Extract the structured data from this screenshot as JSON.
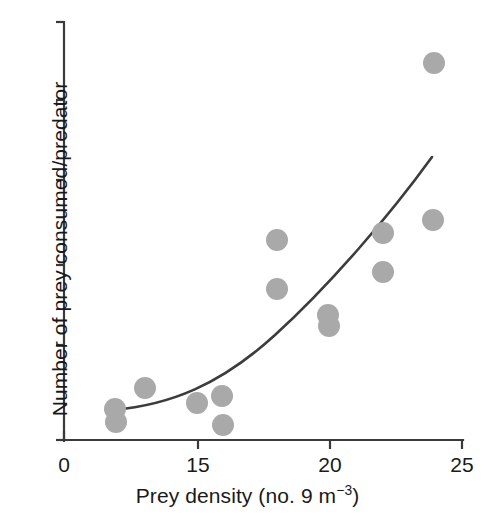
{
  "chart_data": {
    "type": "scatter",
    "title": "",
    "xlabel": "Prey density (no. 9 m−3)",
    "ylabel": "Number of prey consumed/predator",
    "xlabel_main": "Prey density (no. 9 m",
    "xlabel_exponent": "−3",
    "xlabel_tail": ")",
    "grid": false,
    "legend": "none",
    "x_ticks": [
      {
        "label": "0",
        "value": 0,
        "px": 64
      },
      {
        "label": "15",
        "value": 15,
        "px": 198
      },
      {
        "label": "20",
        "value": 20,
        "px": 330
      },
      {
        "label": "25",
        "value": 25,
        "px": 462
      }
    ],
    "y_ticks": [
      {
        "label": "",
        "px": 22
      },
      {
        "label": "",
        "px": 100
      },
      {
        "label": "",
        "px": 180
      },
      {
        "label": "",
        "px": 265
      },
      {
        "label": "",
        "px": 345
      },
      {
        "label": "",
        "px": 440
      }
    ],
    "xlim": [
      0,
      25
    ],
    "ylim": [
      0,
      6
    ],
    "y_axis_labeled": false,
    "marker_color": "#a9a9a9",
    "marker_radius_px": 11,
    "curve_color": "#3c3c3c",
    "axis_color": "#3a3a3a",
    "points": [
      {
        "x": 6,
        "y": 0.45,
        "px": 115,
        "py": 409
      },
      {
        "x": 6,
        "y": 0.3,
        "px": 116,
        "py": 422
      },
      {
        "x": 9,
        "y": 0.72,
        "px": 145,
        "py": 388
      },
      {
        "x": 15,
        "y": 0.54,
        "px": 197,
        "py": 403
      },
      {
        "x": 16,
        "y": 0.62,
        "px": 222,
        "py": 396
      },
      {
        "x": 16,
        "y": 0.2,
        "px": 223,
        "py": 425
      },
      {
        "x": 18,
        "y": 2.58,
        "px": 277,
        "py": 240
      },
      {
        "x": 18,
        "y": 2.02,
        "px": 277,
        "py": 289
      },
      {
        "x": 20,
        "y": 1.72,
        "px": 328,
        "py": 315
      },
      {
        "x": 20,
        "y": 1.6,
        "px": 329,
        "py": 326
      },
      {
        "x": 22,
        "y": 2.66,
        "px": 383,
        "py": 233
      },
      {
        "x": 22,
        "y": 2.2,
        "px": 383,
        "py": 272
      },
      {
        "x": 24,
        "y": 5.05,
        "px": 434,
        "py": 63
      },
      {
        "x": 24,
        "y": 2.84,
        "px": 433,
        "py": 220
      }
    ],
    "fit_curve": {
      "description": "monotonic increasing convex fit line",
      "path_px": "M 113,410 C 170,405 220,385 275,335 C 330,285 390,215 432,157"
    }
  },
  "axes": {
    "y_axis_label": "Number of prey consumed/predator"
  }
}
